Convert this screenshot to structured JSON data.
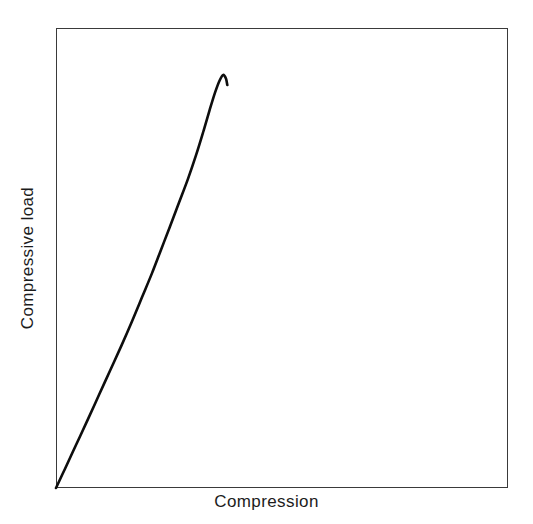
{
  "chart_data": {
    "type": "line",
    "title": "",
    "xlabel": "Compression",
    "ylabel": "Compressive load",
    "legend": null,
    "grid": false,
    "axis_ticks": {
      "x": [],
      "y": []
    },
    "xlim": [
      0,
      1
    ],
    "ylim": [
      0,
      1
    ],
    "series": [
      {
        "name": "compressive load-compression curve",
        "description": "Monotonic rise that is nearly linear at small compression, bends over to a rounded peak (maximum compressive load), then hooks slightly downward at the end.",
        "x": [
          0.0,
          0.02,
          0.045,
          0.07,
          0.095,
          0.12,
          0.145,
          0.168,
          0.19,
          0.212,
          0.232,
          0.252,
          0.272,
          0.292,
          0.31,
          0.326,
          0.34,
          0.352,
          0.362,
          0.37,
          0.376,
          0.379
        ],
        "y": [
          0.0,
          0.042,
          0.095,
          0.148,
          0.202,
          0.256,
          0.31,
          0.362,
          0.414,
          0.466,
          0.517,
          0.568,
          0.62,
          0.672,
          0.724,
          0.775,
          0.822,
          0.86,
          0.886,
          0.898,
          0.89,
          0.876
        ]
      }
    ],
    "annotations": []
  },
  "style": {
    "background_color": "#ffffff",
    "frame_color": "#3a3a3a",
    "curve_color": "#0d0d0d",
    "label_color": "#1c1c1c"
  },
  "axes": {
    "xlabel": "Compression",
    "ylabel": "Compressive load"
  }
}
